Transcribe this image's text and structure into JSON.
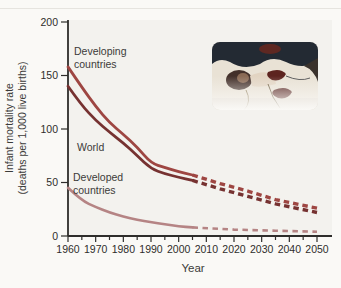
{
  "figure": {
    "y_axis_title_line1": "Infant mortality rate",
    "y_axis_title_line2": "(deaths per 1,000 live births)",
    "x_axis_title": "Year",
    "annotations": {
      "developing": "Developing\ncountries",
      "world": "World",
      "developed": "Developed\ncountries"
    },
    "inset_photo_alt": "Premature infant with medical tubes and wires"
  },
  "chart_data": {
    "type": "line",
    "title": "",
    "xlabel": "Year",
    "ylabel": "Infant mortality rate (deaths per 1,000 live births)",
    "xlim": [
      1960,
      2055
    ],
    "ylim": [
      0,
      200
    ],
    "grid": false,
    "legend_position": "inline-annotations",
    "y_ticks": [
      0,
      50,
      100,
      150,
      200
    ],
    "x_ticks": [
      1960,
      1970,
      1980,
      1990,
      2000,
      2010,
      2020,
      2030,
      2040,
      2050
    ],
    "x_minor_ticks": [
      1965,
      1975,
      1985,
      1995,
      2005,
      2015,
      2025,
      2035,
      2045
    ],
    "projection_start_year": 2005,
    "series": [
      {
        "name": "Developing countries",
        "slug": "developing-countries",
        "color": "#9e4642",
        "width": 2.8,
        "dash_width": 3.4,
        "dash": [
          5.5,
          4
        ],
        "solid": [
          [
            1960,
            158
          ],
          [
            1965,
            139
          ],
          [
            1970,
            121
          ],
          [
            1975,
            106
          ],
          [
            1980,
            95
          ],
          [
            1985,
            83
          ],
          [
            1990,
            68
          ],
          [
            1995,
            64
          ],
          [
            2000,
            60
          ],
          [
            2005,
            57
          ]
        ],
        "projected": [
          [
            2005,
            57
          ],
          [
            2015,
            49
          ],
          [
            2025,
            42
          ],
          [
            2035,
            34
          ],
          [
            2050,
            26
          ]
        ]
      },
      {
        "name": "World",
        "slug": "world",
        "color": "#763231",
        "width": 2.8,
        "dash_width": 3.4,
        "dash": [
          5.5,
          4
        ],
        "solid": [
          [
            1960,
            140
          ],
          [
            1965,
            122
          ],
          [
            1970,
            108
          ],
          [
            1975,
            97
          ],
          [
            1980,
            87
          ],
          [
            1985,
            75
          ],
          [
            1990,
            63
          ],
          [
            1995,
            58
          ],
          [
            2000,
            55
          ],
          [
            2005,
            52
          ]
        ],
        "projected": [
          [
            2005,
            52
          ],
          [
            2015,
            44
          ],
          [
            2025,
            37
          ],
          [
            2035,
            30
          ],
          [
            2050,
            22
          ]
        ]
      },
      {
        "name": "Developed countries",
        "slug": "developed-countries",
        "color": "#b58484",
        "width": 2.6,
        "dash_width": 2.6,
        "dash": [
          5.5,
          4.5
        ],
        "solid": [
          [
            1960,
            45
          ],
          [
            1965,
            33
          ],
          [
            1970,
            27
          ],
          [
            1975,
            22
          ],
          [
            1980,
            18
          ],
          [
            1985,
            15
          ],
          [
            1990,
            13
          ],
          [
            1995,
            11
          ],
          [
            2000,
            9
          ],
          [
            2005,
            8
          ]
        ],
        "projected": [
          [
            2005,
            8
          ],
          [
            2020,
            6
          ],
          [
            2035,
            5
          ],
          [
            2050,
            4
          ]
        ]
      }
    ]
  }
}
